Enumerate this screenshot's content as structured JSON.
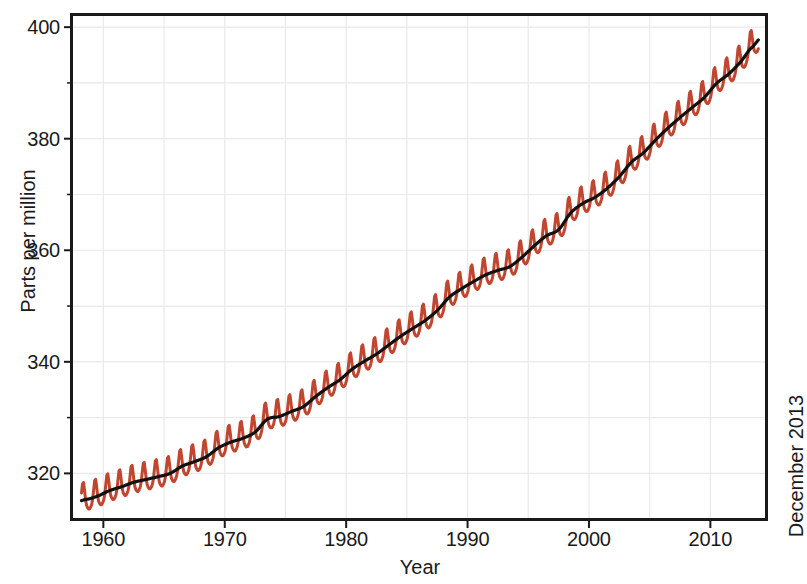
{
  "chart_data": {
    "type": "line",
    "title": "",
    "xlabel": "Year",
    "ylabel": "Parts per million",
    "annotation": "December 2013",
    "xlim": [
      1957.5,
      2014.5
    ],
    "ylim": [
      312.0,
      402.0
    ],
    "grid": true,
    "legend_position": "none",
    "colors": {
      "monthly": "#c0462f",
      "trend": "#111111",
      "grid": "#e9e9e9",
      "axis": "#1a1a1a",
      "background": "#ffffff"
    },
    "x_ticks_major": [
      1960,
      1970,
      1980,
      1990,
      2000,
      2010
    ],
    "x_tick_labels": [
      "1960",
      "1970",
      "1980",
      "1990",
      "2000",
      "2010"
    ],
    "y_ticks_major": [
      320,
      340,
      360,
      380,
      400
    ],
    "y_tick_labels": [
      "320",
      "340",
      "360",
      "380",
      "400"
    ],
    "y_ticks_minor": [
      330,
      350,
      370,
      390
    ],
    "seasonal_amplitude_ppm": 3.1,
    "seasonal_peak_month": 5,
    "series": [
      {
        "name": "Monthly mean CO2",
        "style": "sawtooth-oscillation",
        "color": "#c0462f",
        "linewidth": 3.0
      },
      {
        "name": "Seasonally corrected trend",
        "style": "smooth-trend",
        "color": "#111111",
        "linewidth": 3.2
      }
    ],
    "x": [
      1958.5,
      1959.5,
      1960.5,
      1961.5,
      1962.5,
      1963.5,
      1964.5,
      1965.5,
      1966.5,
      1967.5,
      1968.5,
      1969.5,
      1970.5,
      1971.5,
      1972.5,
      1973.5,
      1974.5,
      1975.5,
      1976.5,
      1977.5,
      1978.5,
      1979.5,
      1980.5,
      1981.5,
      1982.5,
      1983.5,
      1984.5,
      1985.5,
      1986.5,
      1987.5,
      1988.5,
      1989.5,
      1990.5,
      1991.5,
      1992.5,
      1993.5,
      1994.5,
      1995.5,
      1996.5,
      1997.5,
      1998.5,
      1999.5,
      2000.5,
      2001.5,
      2002.5,
      2003.5,
      2004.5,
      2005.5,
      2006.5,
      2007.5,
      2008.5,
      2009.5,
      2010.5,
      2011.5,
      2012.5,
      2013.5
    ],
    "values": [
      315.3,
      315.9,
      316.9,
      317.6,
      318.4,
      318.9,
      319.4,
      320.0,
      321.3,
      322.1,
      323.0,
      324.6,
      325.6,
      326.3,
      327.4,
      329.7,
      330.2,
      331.1,
      332.0,
      333.8,
      335.4,
      336.8,
      338.7,
      340.1,
      341.4,
      343.0,
      344.6,
      346.0,
      347.4,
      349.2,
      351.6,
      353.1,
      354.4,
      355.6,
      356.4,
      357.1,
      358.8,
      360.8,
      362.6,
      363.7,
      366.7,
      368.4,
      369.5,
      371.1,
      373.2,
      375.8,
      377.5,
      379.8,
      381.9,
      383.8,
      385.6,
      387.4,
      389.9,
      391.6,
      393.8,
      396.5
    ],
    "first_point": {
      "year": 1958.2,
      "value": 315.2
    },
    "last_point": {
      "year": 2013.95,
      "value": 396.8
    },
    "max_value": 400.0,
    "min_value": 313.0
  },
  "axes": {
    "y_ticks": [
      {
        "label": "400",
        "value": 400
      },
      {
        "label": "380",
        "value": 380
      },
      {
        "label": "360",
        "value": 360
      },
      {
        "label": "340",
        "value": 340
      },
      {
        "label": "320",
        "value": 320
      }
    ],
    "x_ticks": [
      {
        "label": "1960",
        "value": 1960
      },
      {
        "label": "1970",
        "value": 1970
      },
      {
        "label": "1980",
        "value": 1980
      },
      {
        "label": "1990",
        "value": 1990
      },
      {
        "label": "2000",
        "value": 2000
      },
      {
        "label": "2010",
        "value": 2010
      }
    ],
    "x_title": "Year",
    "y_title": "Parts per million"
  },
  "annotation": {
    "right_side_label": "December 2013"
  }
}
